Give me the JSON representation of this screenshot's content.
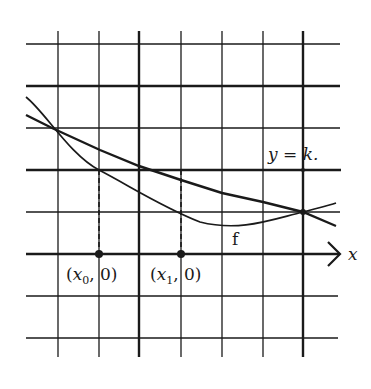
{
  "diagram": {
    "type": "function-graph-on-grid",
    "axis_label_x": "x",
    "line_label": "y = k.",
    "curve_label": "f",
    "points": [
      {
        "label_prefix": "(",
        "var": "x",
        "sub": "0",
        "label_suffix": ", 0)"
      },
      {
        "label_prefix": "(",
        "var": "x",
        "sub": "1",
        "label_suffix": ", 0)"
      }
    ],
    "colors": {
      "ink": "#1a1a1a",
      "background": "#ffffff"
    }
  }
}
